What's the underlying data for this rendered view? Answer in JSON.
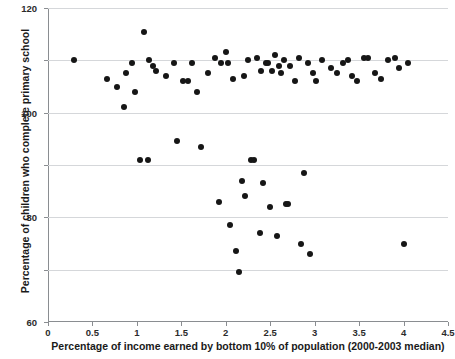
{
  "chart_data": {
    "type": "scatter",
    "title": "",
    "xlabel": "Percentage of income earned by bottom 10% of population (2000-2003 median)",
    "ylabel": "Percentage of children who complete primary school",
    "xlim": [
      0,
      4.5
    ],
    "ylim": [
      0,
      120
    ],
    "xticks": [
      "0",
      "0.5",
      "1",
      "1.5",
      "2",
      "2.5",
      "3",
      "3.5",
      "4",
      "4.5"
    ],
    "xtick_values": [
      0,
      0.5,
      1,
      1.5,
      2,
      2.5,
      3,
      3.5,
      4,
      4.5
    ],
    "yticks": [
      "0",
      "20",
      "40",
      "60",
      "80",
      "100",
      "120"
    ],
    "ytick_values": [
      0,
      20,
      40,
      60,
      80,
      100,
      120
    ],
    "grid": "horizontal",
    "legend": "none",
    "marker": "filled-circle",
    "marker_color": "#161616",
    "points": [
      [
        0.29,
        100
      ],
      [
        0.66,
        93
      ],
      [
        0.78,
        90
      ],
      [
        0.86,
        82
      ],
      [
        0.88,
        95
      ],
      [
        0.95,
        99
      ],
      [
        0.98,
        88
      ],
      [
        1.03,
        62
      ],
      [
        1.08,
        111
      ],
      [
        1.12,
        62
      ],
      [
        1.14,
        100
      ],
      [
        1.18,
        98
      ],
      [
        1.22,
        96
      ],
      [
        1.33,
        94
      ],
      [
        1.42,
        99
      ],
      [
        1.45,
        69
      ],
      [
        1.52,
        92
      ],
      [
        1.58,
        92
      ],
      [
        1.62,
        99
      ],
      [
        1.68,
        88
      ],
      [
        1.72,
        67
      ],
      [
        1.8,
        95
      ],
      [
        1.88,
        101
      ],
      [
        1.92,
        46
      ],
      [
        1.95,
        99
      ],
      [
        2.0,
        103
      ],
      [
        2.02,
        99
      ],
      [
        2.05,
        37
      ],
      [
        2.08,
        93
      ],
      [
        2.12,
        27
      ],
      [
        2.15,
        19
      ],
      [
        2.18,
        54
      ],
      [
        2.2,
        94
      ],
      [
        2.22,
        48
      ],
      [
        2.25,
        100
      ],
      [
        2.28,
        62
      ],
      [
        2.32,
        62
      ],
      [
        2.35,
        101
      ],
      [
        2.38,
        34
      ],
      [
        2.4,
        96
      ],
      [
        2.42,
        53
      ],
      [
        2.45,
        99
      ],
      [
        2.48,
        99
      ],
      [
        2.5,
        44
      ],
      [
        2.52,
        96
      ],
      [
        2.55,
        102
      ],
      [
        2.58,
        33
      ],
      [
        2.6,
        98
      ],
      [
        2.62,
        95
      ],
      [
        2.65,
        100
      ],
      [
        2.68,
        45
      ],
      [
        2.7,
        45
      ],
      [
        2.72,
        98
      ],
      [
        2.78,
        92
      ],
      [
        2.82,
        101
      ],
      [
        2.85,
        30
      ],
      [
        2.88,
        57
      ],
      [
        2.92,
        99
      ],
      [
        2.95,
        26
      ],
      [
        2.98,
        95
      ],
      [
        3.02,
        92
      ],
      [
        3.08,
        100
      ],
      [
        3.18,
        97
      ],
      [
        3.25,
        95
      ],
      [
        3.32,
        99
      ],
      [
        3.38,
        100
      ],
      [
        3.42,
        94
      ],
      [
        3.48,
        92
      ],
      [
        3.55,
        101
      ],
      [
        3.6,
        101
      ],
      [
        3.68,
        95
      ],
      [
        3.75,
        93
      ],
      [
        3.82,
        100
      ],
      [
        3.9,
        101
      ],
      [
        3.95,
        97
      ],
      [
        4.0,
        30
      ],
      [
        4.05,
        99
      ]
    ]
  }
}
